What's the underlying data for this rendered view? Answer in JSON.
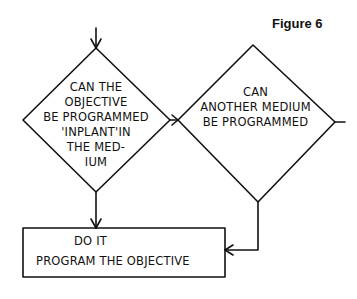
{
  "figure_title": "Figure 6",
  "nodes": {
    "decision1": {
      "lines": [
        "CAN THE",
        "OBJECTIVE",
        "BE PROGRAMMED",
        "'INPLANT'IN",
        "THE MED-",
        "IUM"
      ]
    },
    "decision2": {
      "lines": [
        "CAN",
        "ANOTHER MEDIUM",
        "BE PROGRAMMED"
      ]
    },
    "action": {
      "lines": [
        "DO IT",
        "PROGRAM THE OBJECTIVE"
      ]
    }
  },
  "edges": [
    {
      "from": "start",
      "to": "decision1"
    },
    {
      "from": "decision1",
      "to": "decision2",
      "side": "right"
    },
    {
      "from": "decision1",
      "to": "action",
      "side": "bottom"
    },
    {
      "from": "decision2",
      "to": "action",
      "side": "bottom"
    },
    {
      "from": "decision2",
      "to": "exit",
      "side": "right"
    }
  ],
  "colors": {
    "stroke": "#111111",
    "background": "#ffffff"
  }
}
